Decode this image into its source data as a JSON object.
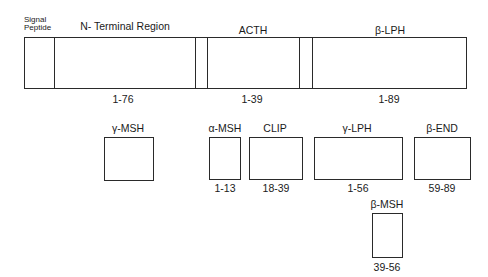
{
  "diagram": {
    "precursor": {
      "segments": [
        {
          "name": "Signal Peptide",
          "line1": "Signal",
          "line2": "Peptide"
        },
        {
          "name": "N- Terminal Region",
          "label": "N- Terminal Region",
          "range": "1-76"
        },
        {
          "name": "ACTH",
          "label": "ACTH",
          "range": "1-39"
        },
        {
          "name": "β-LPH",
          "label": "β-LPH",
          "range": "1-89"
        }
      ]
    },
    "products": [
      {
        "label": "γ-MSH",
        "range": ""
      },
      {
        "label": "α-MSH",
        "range": "1-13"
      },
      {
        "label": "CLIP",
        "range": "18-39"
      },
      {
        "label": "γ-LPH",
        "range": "1-56"
      },
      {
        "label": "β-END",
        "range": "59-89"
      },
      {
        "label": "β-MSH",
        "range": "39-56"
      }
    ],
    "colors": {
      "line": "#2a2a2a",
      "background": "#ffffff",
      "text": "#1a1a1a"
    }
  }
}
